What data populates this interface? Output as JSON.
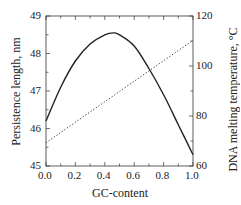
{
  "chart_data": {
    "type": "line",
    "title": "",
    "xlabel": "GC-content",
    "ylabel": "Persistence length, nm",
    "y2label": "DNA melting temperature, °C",
    "xlim": [
      0.0,
      1.0
    ],
    "ylim": [
      45,
      49
    ],
    "y2lim": [
      60,
      120
    ],
    "grid": false,
    "legend": "none",
    "x_ticks": [
      "0.0",
      "0.2",
      "0.4",
      "0.6",
      "0.8",
      "1.0"
    ],
    "y_ticks": [
      "45",
      "46",
      "47",
      "48",
      "49"
    ],
    "y2_ticks": [
      "60",
      "80",
      "100",
      "120"
    ],
    "x": [
      0.0,
      0.1,
      0.2,
      0.3,
      0.4,
      0.46,
      0.5,
      0.6,
      0.7,
      0.8,
      0.9,
      1.0
    ],
    "series": [
      {
        "name": "Persistence length",
        "axis": "left",
        "style": "solid",
        "values": [
          46.2,
          47.1,
          47.8,
          48.25,
          48.5,
          48.55,
          48.5,
          48.2,
          47.6,
          46.9,
          46.1,
          45.3
        ]
      },
      {
        "name": "DNA melting temperature",
        "axis": "right",
        "style": "dotted",
        "values": [
          69.3,
          73.4,
          77.5,
          81.6,
          85.7,
          88.2,
          89.8,
          93.9,
          98.0,
          102.1,
          106.2,
          110.3
        ]
      }
    ]
  }
}
